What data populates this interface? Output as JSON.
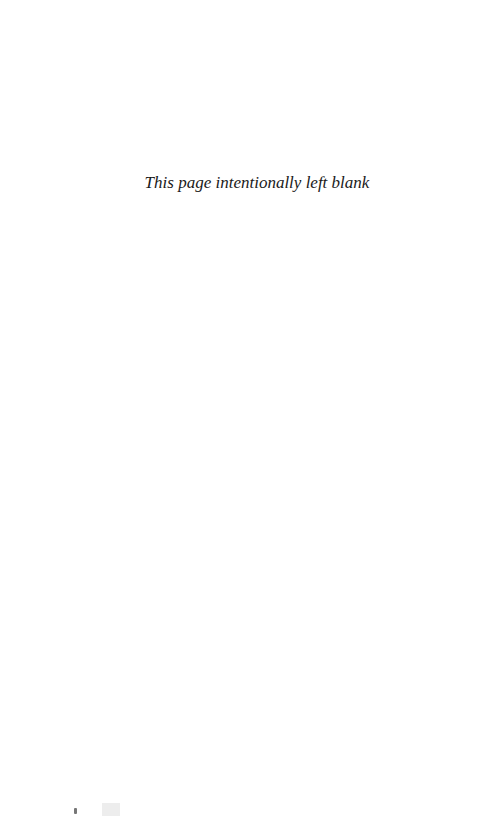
{
  "page": {
    "message": "This page intentionally left blank"
  }
}
